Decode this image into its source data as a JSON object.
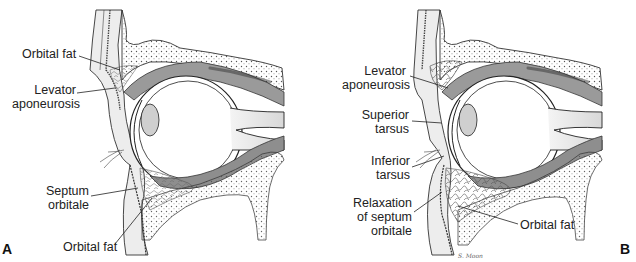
{
  "figure": {
    "panels": [
      {
        "id": "A",
        "letter": "A",
        "labels": [
          {
            "text": "Orbital fat",
            "lines": [
              "Orbital fat"
            ]
          },
          {
            "text": "Levator aponeurosis",
            "lines": [
              "Levator",
              "aponeurosis"
            ]
          },
          {
            "text": "Septum orbitale",
            "lines": [
              "Septum",
              "orbitale"
            ]
          },
          {
            "text": "Orbital fat",
            "lines": [
              "Orbital fat"
            ]
          }
        ]
      },
      {
        "id": "B",
        "letter": "B",
        "labels": [
          {
            "text": "Levator aponeurosis",
            "lines": [
              "Levator",
              "aponeurosis"
            ]
          },
          {
            "text": "Superior tarsus",
            "lines": [
              "Superior",
              "tarsus"
            ]
          },
          {
            "text": "Inferior tarsus",
            "lines": [
              "Inferior",
              "tarsus"
            ]
          },
          {
            "text": "Relaxation of septum orbitale",
            "lines": [
              "Relaxation",
              "of septum",
              "orbitale"
            ]
          },
          {
            "text": "Orbital fat",
            "lines": [
              "Orbital fat"
            ]
          }
        ],
        "signature": "S. Moon"
      }
    ],
    "colors": {
      "ink": "#222222",
      "tissue_gray": "#9a9a9a",
      "muscle_dark": "#6e6e6e",
      "bone_light": "#e6e6e6",
      "background": "#ffffff"
    }
  }
}
